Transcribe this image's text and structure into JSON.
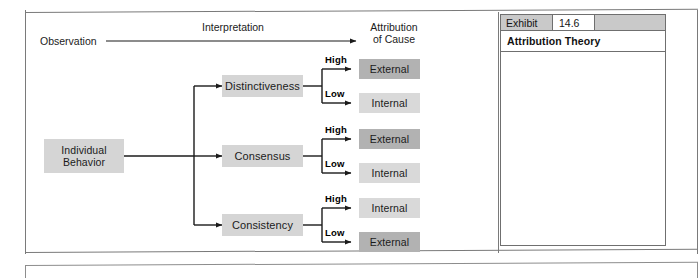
{
  "exhibit": {
    "label": "Exhibit",
    "number": "14.6",
    "title": "Attribution Theory"
  },
  "diagram": {
    "top_flow": {
      "source_label": "Observation",
      "arrow_label": "Interpretation",
      "target_line1": "Attribution",
      "target_line2": "of Cause"
    },
    "root": {
      "line1": "Individual",
      "line2": "Behavior"
    },
    "branches": [
      {
        "factor": "Distinctiveness",
        "high_label": "High",
        "high_outcome": "External",
        "low_label": "Low",
        "low_outcome": "Internal"
      },
      {
        "factor": "Consensus",
        "high_label": "High",
        "high_outcome": "External",
        "low_label": "Low",
        "low_outcome": "Internal"
      },
      {
        "factor": "Consistency",
        "high_label": "High",
        "high_outcome": "Internal",
        "low_label": "Low",
        "low_outcome": "External"
      }
    ],
    "colors": {
      "factor_fill": "#d5d5d5",
      "external_fill": "#b2b2b2",
      "internal_fill": "#d9d9d9",
      "line": "#1b1b1b"
    }
  }
}
